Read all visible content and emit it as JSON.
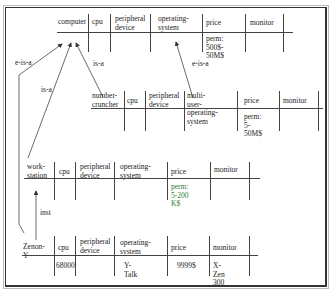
{
  "diagram": {
    "frames": [
      {
        "id": "computer",
        "headers": [
          "computer",
          "cpu",
          "peripheral\ndevice",
          "operating-\nsystem",
          "price",
          "monitor"
        ],
        "values": [
          "",
          "",
          "",
          "",
          "perm: 500$-\n50M$",
          ""
        ]
      },
      {
        "id": "number-cruncher",
        "headers": [
          "number-\ncruncher",
          "cpu",
          "peripheral\ndevice",
          "multi-user-\noperating-system",
          "price",
          "monitor"
        ],
        "values": [
          "",
          "",
          "",
          "",
          "perm: 5-\n50M$",
          ""
        ]
      },
      {
        "id": "work-station",
        "headers": [
          "work-\nstation",
          "cpu",
          "peripheral\ndevice",
          "operating-\nsystem",
          "price",
          "monitor"
        ],
        "values": [
          "",
          "",
          "",
          "",
          "perm: 5-200\nK$",
          ""
        ]
      },
      {
        "id": "zenon-y",
        "headers": [
          "Zenon-Y",
          "cpu",
          "peripheral\ndevice",
          "operating-\nsystem",
          "price",
          "monitor"
        ],
        "values": [
          "",
          "68000",
          "",
          "Y-Talk",
          "9999$",
          "X-Zen 300"
        ]
      }
    ],
    "relations": [
      {
        "label": "e-is-a",
        "from": "zenon-y",
        "to": "computer"
      },
      {
        "label": "is-a",
        "from": "work-station",
        "to": "computer"
      },
      {
        "label": "is-a",
        "from": "number-cruncher",
        "to": "computer"
      },
      {
        "label": "e-is-a",
        "from": "number-cruncher.multi-user-operating-system",
        "to": "computer.operating-system"
      },
      {
        "label": "inst",
        "from": "zenon-y",
        "to": "work-station"
      }
    ],
    "colors": {
      "line": "#444444",
      "text": "#222222",
      "accent_green": "#2e7d32"
    }
  }
}
